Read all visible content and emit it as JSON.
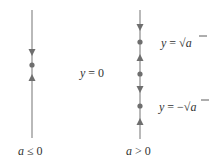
{
  "diagram": {
    "type": "phase_lines",
    "colors": {
      "line": "#8a8a8a",
      "marker": "#6e6e6e",
      "text": "#333333"
    },
    "panels": [
      {
        "id": "a-nonpositive",
        "caption": "a ≤ 0",
        "caption_var": "a",
        "caption_rel": "≤ 0",
        "line": {
          "x": 32,
          "y_top": 10,
          "y_bottom": 138
        },
        "markers": [
          {
            "kind": "arrow-down",
            "y": 52
          },
          {
            "kind": "dot",
            "y": 65,
            "label": "y = 0"
          },
          {
            "kind": "arrow-up",
            "y": 78
          }
        ]
      },
      {
        "id": "a-positive",
        "caption": "a > 0",
        "caption_var": "a",
        "caption_rel": "> 0",
        "line": {
          "x": 140,
          "y_top": 10,
          "y_bottom": 139
        },
        "markers": [
          {
            "kind": "arrow-down",
            "y": 27
          },
          {
            "kind": "dot",
            "y": 42,
            "label": "y = √a"
          },
          {
            "kind": "arrow-up",
            "y": 58
          },
          {
            "kind": "dot",
            "y": 74
          },
          {
            "kind": "arrow-down",
            "y": 89
          },
          {
            "kind": "dot",
            "y": 106,
            "label": "y = −√a"
          },
          {
            "kind": "arrow-up",
            "y": 122
          }
        ]
      }
    ],
    "labels": {
      "equilibrium_zero": {
        "var": "y",
        "eq": "= 0"
      },
      "equilibrium_pos_sqrt": {
        "var": "y",
        "eq": "= √",
        "rad": "a"
      },
      "equilibrium_neg_sqrt": {
        "var": "y",
        "eq": "= −√",
        "rad": "a"
      }
    }
  }
}
